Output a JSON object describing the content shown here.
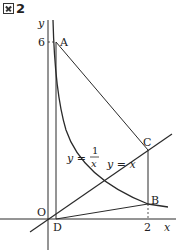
{
  "figure": {
    "label_text": "2",
    "label_icon": "zu-kanji-box-icon"
  },
  "axes": {
    "x_label": "x",
    "y_label": "y",
    "origin_label": "O",
    "y_tick": "6",
    "x_tick": "2"
  },
  "points": {
    "A": "A",
    "B": "B",
    "C": "C",
    "D": "D"
  },
  "curves": {
    "hyperbola_label_lhs": "y =",
    "hyperbola_num": "1",
    "hyperbola_den": "x",
    "line_label": "y = x"
  },
  "colors": {
    "stroke": "#2a2a2a",
    "text": "#222222"
  }
}
